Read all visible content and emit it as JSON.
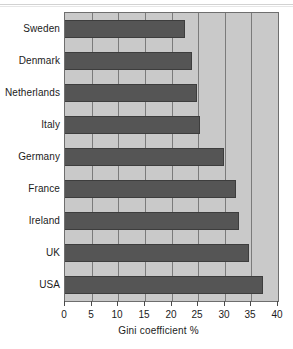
{
  "chart_data": {
    "type": "bar",
    "orientation": "horizontal",
    "title": "",
    "xlabel": "Gini coefficient %",
    "ylabel": "",
    "xlim": [
      0,
      40
    ],
    "xticks": [
      0,
      5,
      10,
      15,
      20,
      25,
      30,
      35,
      40
    ],
    "grid": true,
    "legend": null,
    "categories": [
      "Sweden",
      "Denmark",
      "Netherlands",
      "Italy",
      "Germany",
      "France",
      "Ireland",
      "UK",
      "USA"
    ],
    "values": [
      22.6,
      23.8,
      24.7,
      25.4,
      29.9,
      32.2,
      32.6,
      34.5,
      37.1
    ],
    "series": [
      {
        "name": "Gini coefficient %",
        "values": [
          22.6,
          23.8,
          24.7,
          25.4,
          29.9,
          32.2,
          32.6,
          34.5,
          37.1
        ]
      }
    ]
  },
  "colors": {
    "bar": "#555555",
    "bar_edge": "#3d3d3d",
    "plot_background": "#c9c9c9",
    "plot_border": "#6e6e6e",
    "gridline": "#7b7b7b",
    "text": "#1b1b1b",
    "page_background": "#ffffff"
  },
  "axis": {
    "x_title": "Gini coefficient %",
    "x_tick_labels": [
      "0",
      "5",
      "10",
      "15",
      "20",
      "25",
      "30",
      "35",
      "40"
    ],
    "y_tick_labels": [
      "Sweden",
      "Denmark",
      "Netherlands",
      "Italy",
      "Germany",
      "France",
      "Ireland",
      "UK",
      "USA"
    ]
  }
}
